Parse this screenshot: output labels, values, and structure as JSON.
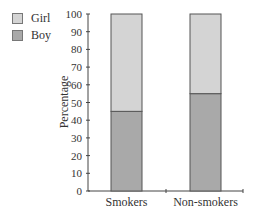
{
  "chart_data": {
    "type": "bar",
    "stacked": true,
    "title": "",
    "xlabel": "",
    "ylabel": "Percentage",
    "ylim": [
      0,
      100
    ],
    "yticks": [
      0,
      10,
      20,
      30,
      40,
      50,
      60,
      70,
      80,
      90,
      100
    ],
    "categories": [
      "Smokers",
      "Non-smokers"
    ],
    "series": [
      {
        "name": "Boy",
        "values": [
          45,
          55
        ],
        "color": "#a9a9a9"
      },
      {
        "name": "Girl",
        "values": [
          55,
          45
        ],
        "color": "#d4d4d4"
      }
    ],
    "legend": {
      "position": "top-left",
      "entries": [
        {
          "label": "Girl",
          "color": "#d4d4d4"
        },
        {
          "label": "Boy",
          "color": "#a9a9a9"
        }
      ]
    },
    "grid": false
  }
}
